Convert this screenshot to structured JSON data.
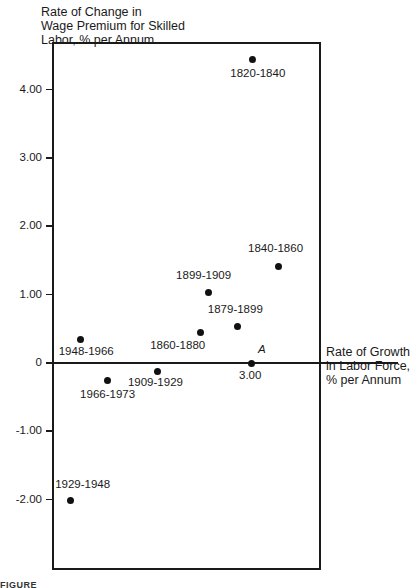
{
  "chart_data": {
    "type": "scatter",
    "title": "",
    "ylabel": "Rate of Change in\nWage Premium for Skilled\nLabor, % per Annum",
    "xlabel": "Rate of Growth\nin Labor Force,\n% per Annum",
    "yticks": [
      "4.00",
      "3.00",
      "2.00",
      "1.00",
      "0",
      "-1.00",
      "-2.00"
    ],
    "ytick_values": [
      4,
      3,
      2,
      1,
      0,
      -1,
      -2
    ],
    "xticks": [
      "3.00"
    ],
    "xtick_values": [
      3
    ],
    "ylim": [
      -3.05,
      4.7
    ],
    "xlim": [
      0,
      4.05
    ],
    "grid": false,
    "legend": null,
    "points": [
      {
        "label": "1820-1840",
        "x": 3.02,
        "y": 4.45
      },
      {
        "label": "1840-1860",
        "x": 3.41,
        "y": 1.42
      },
      {
        "label": "1899-1909",
        "x": 2.35,
        "y": 1.03
      },
      {
        "label": "1879-1899",
        "x": 2.8,
        "y": 0.53
      },
      {
        "label": "1860-1880",
        "x": 2.23,
        "y": 0.44
      },
      {
        "label": "1948-1966",
        "x": 0.42,
        "y": 0.34
      },
      {
        "label": "1909-1929",
        "x": 1.59,
        "y": -0.12
      },
      {
        "label": "1966-1973",
        "x": 0.82,
        "y": -0.25
      },
      {
        "label": "1929-1948",
        "x": 0.26,
        "y": -2.01
      }
    ],
    "annotations": [
      {
        "label": "A",
        "x": 3.0,
        "y": 0
      }
    ]
  },
  "caption_fragment": "FIGURE"
}
